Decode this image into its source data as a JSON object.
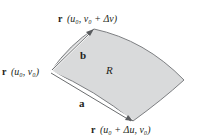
{
  "diagram": {
    "type": "parametric-surface-patch",
    "colors": {
      "patch_fill": "#d9dadb",
      "patch_edge": "#7d7f82",
      "vector": "#5a5c5f",
      "vector_highlight": "#ffffff",
      "text": "#231f20"
    },
    "labels": {
      "corner_origin": "r (u₀, v₀)",
      "corner_top": "r (u₀, v₀ + Δv)",
      "corner_bottom": "r (u₀ + Δu, v₀)",
      "vector_a": "a",
      "vector_b": "b",
      "region": "R"
    },
    "label_parts": {
      "r": "r",
      "origin_args": "(u₀, v₀)",
      "top_args": "(u₀, v₀ + Δv)",
      "bottom_args": "(u₀ + Δu, v₀)"
    }
  }
}
